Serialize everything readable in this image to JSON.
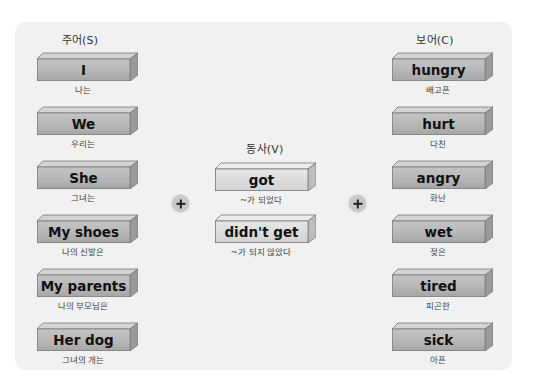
{
  "columns": {
    "subject": {
      "header": "주어(S)",
      "items": [
        {
          "word": "I",
          "gloss": "나는"
        },
        {
          "word": "We",
          "gloss": "우리는"
        },
        {
          "word": "She",
          "gloss": "그녀는"
        },
        {
          "word": "My shoes",
          "gloss": "나의 신발은"
        },
        {
          "word": "My parents",
          "gloss": "나의 부모님은"
        },
        {
          "word": "Her dog",
          "gloss": "그녀의 개는"
        }
      ]
    },
    "verb": {
      "header": "동사(V)",
      "items": [
        {
          "word": "got",
          "gloss": "~가 되었다"
        },
        {
          "word": "didn't get",
          "gloss": "~가 되지 않았다"
        }
      ]
    },
    "complement": {
      "header": "보어(C)",
      "items": [
        {
          "word": "hungry",
          "gloss": "배고픈"
        },
        {
          "word": "hurt",
          "gloss": "다친"
        },
        {
          "word": "angry",
          "gloss": "화난"
        },
        {
          "word": "wet",
          "gloss": "젖은"
        },
        {
          "word": "tired",
          "gloss": "피곤한"
        },
        {
          "word": "sick",
          "gloss": "아픈"
        }
      ]
    }
  },
  "operators": [
    {
      "symbol": "plus-icon"
    },
    {
      "symbol": "plus-icon"
    }
  ],
  "colors": {
    "panel_bg": "#f1f1f1",
    "block_dark_face": "#b4b4b4",
    "block_light_face": "#dcdcdc",
    "plus_bg": "#c9c9c9"
  }
}
